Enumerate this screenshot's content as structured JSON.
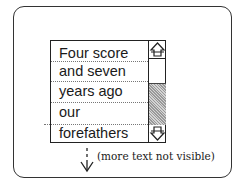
{
  "textbox": {
    "lines": [
      "Four score",
      "and seven",
      "years ago",
      "our",
      "forefathers"
    ]
  },
  "scrollbar": {
    "up_arrow": "scroll-up-arrow",
    "down_arrow": "scroll-down-arrow",
    "thumb_color": "#b5b5b5"
  },
  "annotation": {
    "caption": "(more text not visible)",
    "arrow": "dashed-down-arrow"
  }
}
